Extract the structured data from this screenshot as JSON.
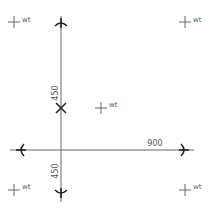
{
  "diagram": {
    "type": "dimensioned layout sketch",
    "colors": {
      "line": "#555555",
      "tick": "#222222",
      "text": "#555555",
      "background": "#ffffff"
    },
    "dimensions": {
      "vertical_upper": "450",
      "vertical_lower": "450",
      "horizontal": "900"
    },
    "markers": [
      {
        "label": "wt",
        "x": 14,
        "y": 22
      },
      {
        "label": "wt",
        "x": 185,
        "y": 22
      },
      {
        "label": "wt",
        "x": 101,
        "y": 108
      },
      {
        "label": "wt",
        "x": 14,
        "y": 190
      },
      {
        "label": "wt",
        "x": 185,
        "y": 190
      }
    ]
  }
}
